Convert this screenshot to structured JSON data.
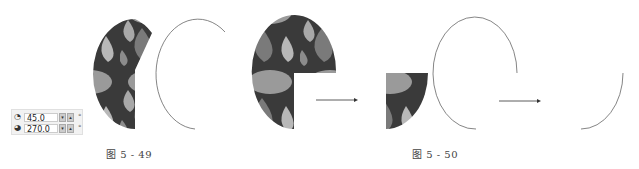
{
  "panel": {
    "start_angle": {
      "icon": "angle-start-icon",
      "value": "45.0",
      "unit": "°"
    },
    "end_angle": {
      "icon": "angle-end-icon",
      "value": "270.0",
      "unit": "°"
    }
  },
  "captions": {
    "fig49": "图 5 - 49",
    "fig50": "图 5 - 50"
  },
  "colors": {
    "pattern_light": "#a8a8a8",
    "pattern_mid": "#7a7a7a",
    "pattern_dark": "#3a3a3a",
    "line": "#555555"
  }
}
